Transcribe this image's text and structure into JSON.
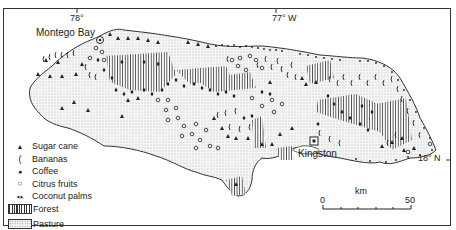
{
  "map": {
    "subject": "Jamaica agricultural land use",
    "longitude_labels": [
      "78°",
      "77° W"
    ],
    "latitude_labels": [
      "18° N"
    ],
    "places": [
      {
        "name": "Montego Bay",
        "symbol": "city-circle"
      },
      {
        "name": "Kingston",
        "symbol": "capital-square"
      }
    ]
  },
  "legend": {
    "items": [
      {
        "symbol": "▲",
        "label": "Sugar cane"
      },
      {
        "symbol": "(",
        "label": "Bananas"
      },
      {
        "symbol": "●",
        "label": "Coffee"
      },
      {
        "symbol": "○",
        "label": "Citrus fruits"
      },
      {
        "symbol": "•.•.",
        "label": "Coconut palms"
      },
      {
        "symbol": "forest-hatch",
        "label": "Forest"
      },
      {
        "symbol": "pasture-stipple",
        "label": "Pasture"
      }
    ]
  },
  "scale_bar": {
    "unit": "km",
    "start": "0",
    "end": "50"
  },
  "colors": {
    "ink": "#222222",
    "pasture": "#f0f0f0",
    "paper": "#ffffff"
  }
}
